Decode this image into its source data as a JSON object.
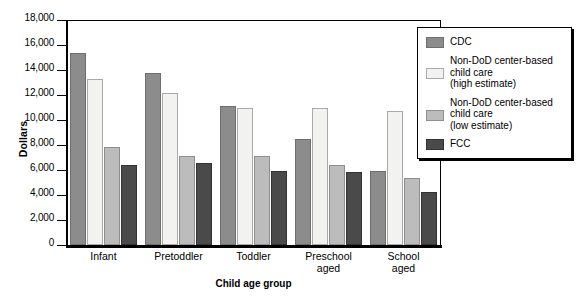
{
  "chart_data": {
    "type": "bar",
    "title": "",
    "xlabel": "Child age group",
    "ylabel": "Dollars",
    "categories": [
      "Infant",
      "Pretoddler",
      "Toddler",
      "Preschool aged",
      "School aged"
    ],
    "series": [
      {
        "name": "CDC",
        "color": "#8c8c8c",
        "values": [
          15400,
          13750,
          11150,
          8500,
          5950
        ]
      },
      {
        "name": "Non-DoD center-based child care (high estimate)",
        "color": "#f2f2f0",
        "values": [
          13250,
          12200,
          11000,
          10950,
          10700
        ]
      },
      {
        "name": "Non-DoD center-based child care (low estimate)",
        "color": "#bcbcbc",
        "values": [
          7850,
          7100,
          7100,
          6400,
          5350
        ]
      },
      {
        "name": "FCC",
        "color": "#4a4a4a",
        "values": [
          6400,
          6550,
          5950,
          5850,
          4250
        ]
      }
    ],
    "ylim": [
      0,
      18000
    ],
    "ytick_step": 2000,
    "yticks": [
      "18,000",
      "16,000",
      "14,000",
      "12,000",
      "10,000",
      "8,000",
      "6,000",
      "4,000",
      "2,000",
      "0"
    ],
    "grid": false,
    "legend_position": "right"
  },
  "legend": {
    "entries": [
      {
        "label": "CDC",
        "color": "#8c8c8c"
      },
      {
        "label": "Non-DoD center-based\nchild care\n(high estimate)",
        "color": "#f2f2f0"
      },
      {
        "label": "Non-DoD center-based\nchild care\n(low estimate)",
        "color": "#bcbcbc"
      },
      {
        "label": "FCC",
        "color": "#4a4a4a"
      }
    ]
  }
}
